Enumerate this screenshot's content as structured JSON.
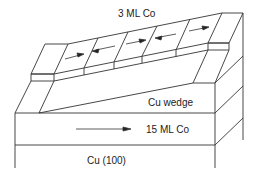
{
  "labels": {
    "top_layer": "3 ML Co",
    "wedge": "Cu wedge",
    "bottom_layer": "15 ML Co",
    "substrate": "Cu (100)"
  },
  "domains": {
    "top_layer_arrows": [
      "right",
      "left",
      "right",
      "left",
      "right"
    ],
    "bottom_layer_arrow": "right"
  },
  "colors": {
    "line": "#333333",
    "background": "#ffffff"
  }
}
